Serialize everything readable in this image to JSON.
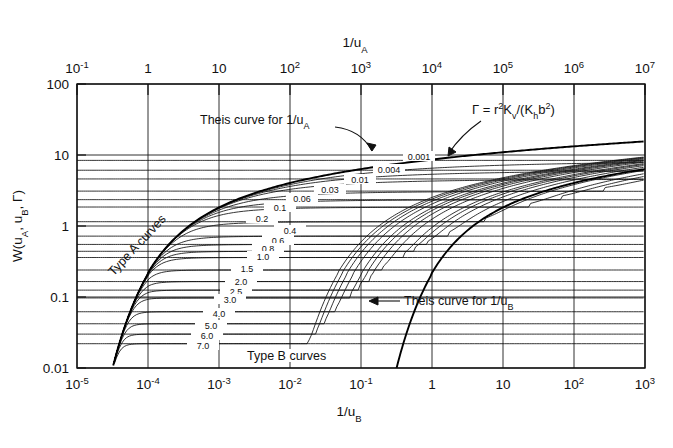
{
  "figure": {
    "axes": {
      "top": {
        "title": "1/u_A",
        "title_base": "1/u",
        "title_sub": "A",
        "min_exp": -1,
        "max_exp": 7,
        "ticks": [
          "10-1",
          "1",
          "10",
          "102",
          "103",
          "104",
          "105",
          "106",
          "107"
        ],
        "tick_labels": [
          {
            "base": "10",
            "sup": "-1"
          },
          {
            "base": "1",
            "sup": ""
          },
          {
            "base": "10",
            "sup": ""
          },
          {
            "base": "10",
            "sup": "2"
          },
          {
            "base": "10",
            "sup": "3"
          },
          {
            "base": "10",
            "sup": "4"
          },
          {
            "base": "10",
            "sup": "5"
          },
          {
            "base": "10",
            "sup": "6"
          },
          {
            "base": "10",
            "sup": "7"
          }
        ]
      },
      "bottom": {
        "title": "1/u_B",
        "title_base": "1/u",
        "title_sub": "B",
        "min_exp": -5,
        "max_exp": 3,
        "tick_labels": [
          {
            "base": "10",
            "sup": "-5"
          },
          {
            "base": "10",
            "sup": "-4"
          },
          {
            "base": "10",
            "sup": "-3"
          },
          {
            "base": "10",
            "sup": "-2"
          },
          {
            "base": "10",
            "sup": "-1"
          },
          {
            "base": "1",
            "sup": ""
          },
          {
            "base": "10",
            "sup": ""
          },
          {
            "base": "10",
            "sup": "2"
          },
          {
            "base": "10",
            "sup": "3"
          }
        ]
      },
      "left": {
        "title_parts": [
          "W(u",
          "A",
          ", u",
          "B",
          ", ",
          "Γ",
          ")"
        ],
        "title": "W(uA, uB, Γ)",
        "min_exp": -2,
        "max_exp": 2,
        "tick_labels": [
          "100",
          "10",
          "1",
          "0.1",
          "0.01"
        ]
      }
    },
    "annotations": {
      "gamma_formula": "Γ = r²Kᵥ/(Kₕb²)",
      "gamma_formula_parts": {
        "lead": "Γ = r",
        "sup1": "2",
        "k1": "K",
        "sub1": "v",
        "mid": "/(K",
        "sub2": "h",
        "b": "b",
        "sup2": "2",
        "close": ")"
      },
      "theis_a": "Theis curve for 1/u_A",
      "theis_a_base": "Theis curve for 1/u",
      "theis_a_sub": "A",
      "theis_b": "Theis curve for 1/u_B",
      "theis_b_base": "Theis curve for 1/u",
      "theis_b_sub": "B",
      "type_a": "Type A curves",
      "type_b": "Type B curves"
    },
    "chart_data": {
      "type": "line",
      "title": "",
      "xlabel": "1/u_B",
      "xlabel_top": "1/u_A",
      "ylabel": "W(u_A, u_B, Γ)",
      "xscale": "log",
      "yscale": "log",
      "xlim_bottom": [
        1e-05,
        1000.0
      ],
      "xlim_top": [
        0.1,
        10000000.0
      ],
      "ylim": [
        0.01,
        100
      ],
      "grid": true,
      "legend": "none",
      "parameter_name": "Γ",
      "parameter_definition": "Γ = r²Kv/(Kh b²)",
      "gamma_values_labeled": [
        "0.001",
        "0.004",
        "0.01",
        "0.03",
        "0.06",
        "0.1",
        "0.2",
        "0.4",
        "0.6",
        "0.8",
        "1.0",
        "1.5",
        "2.0",
        "2.5",
        "3.0",
        "4.0",
        "5.0",
        "6.0",
        "7.0"
      ],
      "gamma_values": [
        0.001,
        0.004,
        0.01,
        0.03,
        0.06,
        0.1,
        0.2,
        0.4,
        0.6,
        0.8,
        1.0,
        1.5,
        2.0,
        2.5,
        3.0,
        4.0,
        5.0,
        6.0,
        7.0
      ],
      "type_a_plateaus": [
        8.4,
        6.1,
        4.6,
        3.1,
        2.35,
        1.85,
        1.15,
        0.72,
        0.55,
        0.44,
        0.36,
        0.24,
        0.165,
        0.125,
        0.097,
        0.062,
        0.042,
        0.03,
        0.022
      ],
      "series": [
        {
          "name": "Theis curve for 1/u_A",
          "role": "envelope-upper"
        },
        {
          "name": "Theis curve for 1/u_B",
          "role": "envelope-lower"
        },
        {
          "name": "Type A curves",
          "role": "family-early-time"
        },
        {
          "name": "Type B curves",
          "role": "family-late-time"
        }
      ],
      "notes": "Neuman type curves for an unconfined aquifer with delayed gravity response; W plotted against 1/uA (top scale, Type A) and 1/uB (bottom scale, Type B) for a family of Γ values."
    }
  }
}
